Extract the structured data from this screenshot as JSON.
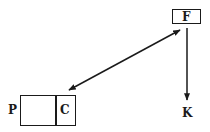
{
  "diagram": {
    "nodes": [
      {
        "id": "F",
        "label": "F",
        "shape": "box"
      },
      {
        "id": "P",
        "label": "P",
        "shape": "text"
      },
      {
        "id": "C",
        "label": "C",
        "shape": "box-compartment"
      },
      {
        "id": "K",
        "label": "K",
        "shape": "text"
      }
    ],
    "edges": [
      {
        "from": "F",
        "to": "C",
        "type": "bidirectional-arrow"
      },
      {
        "from": "F",
        "to": "K",
        "type": "arrow"
      }
    ],
    "colors": {
      "stroke": "#1a1a1a",
      "background": "#ffffff"
    }
  }
}
